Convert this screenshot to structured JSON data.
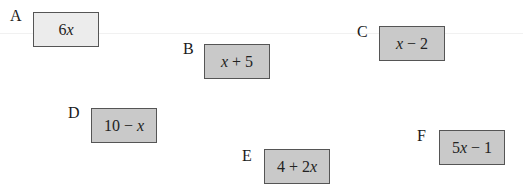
{
  "cards": [
    {
      "letter": "A",
      "expression": "6x",
      "parts": [
        "6",
        "x",
        ""
      ],
      "fill": "#ececec"
    },
    {
      "letter": "B",
      "expression": "x + 5",
      "parts": [
        "",
        "x",
        " + 5"
      ],
      "fill": "#c9c9c9"
    },
    {
      "letter": "C",
      "expression": "x − 2",
      "parts": [
        "",
        "x",
        " − 2"
      ],
      "fill": "#c9c9c9"
    },
    {
      "letter": "D",
      "expression": "10 − x",
      "parts": [
        "10 − ",
        "x",
        ""
      ],
      "fill": "#c9c9c9"
    },
    {
      "letter": "E",
      "expression": "4 + 2x",
      "parts": [
        "4 + 2",
        "x",
        ""
      ],
      "fill": "#c9c9c9"
    },
    {
      "letter": "F",
      "expression": "5x − 1",
      "parts": [
        "5",
        "x",
        " − 1"
      ],
      "fill": "#c9c9c9"
    }
  ]
}
